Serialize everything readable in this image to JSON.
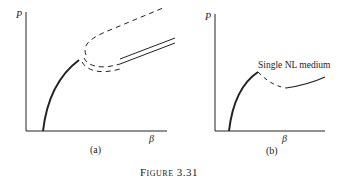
{
  "figure": {
    "caption": "Figure 3.31",
    "panels": [
      {
        "id": "a",
        "label": "(a)",
        "y_axis_label": "P",
        "x_axis_label": "β",
        "curves": [
          {
            "name": "stable-low-branch",
            "style": "solid-thick"
          },
          {
            "name": "outer-dashed-branch",
            "style": "dashed"
          },
          {
            "name": "inner-dashed-branch",
            "style": "dashed"
          },
          {
            "name": "upper-solid-branch",
            "style": "solid"
          },
          {
            "name": "lower-solid-branch",
            "style": "solid"
          }
        ]
      },
      {
        "id": "b",
        "label": "(b)",
        "y_axis_label": "P",
        "x_axis_label": "β",
        "annotation": "Single NL medium",
        "curves": [
          {
            "name": "stable-low-branch",
            "style": "solid-thick"
          },
          {
            "name": "unstable-branch",
            "style": "dashed"
          },
          {
            "name": "high-branch",
            "style": "solid"
          }
        ]
      }
    ]
  }
}
